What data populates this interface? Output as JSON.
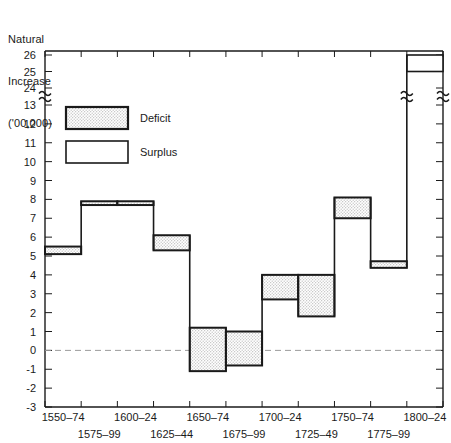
{
  "chart_data": {
    "type": "bar",
    "title": "",
    "ylabel_lines": [
      "Natural",
      "Increase",
      "('00,000)"
    ],
    "xlabel": "",
    "categories": [
      "1550–74",
      "1575–99",
      "1600–24",
      "1625–44",
      "1650–74",
      "1675–99",
      "1700–24",
      "1725–49",
      "1750–74",
      "1775–99",
      "1800–24"
    ],
    "y_tick_labels": [
      "-3",
      "-2",
      "-1",
      "0",
      "1",
      "2",
      "3",
      "4",
      "5",
      "6",
      "7",
      "8",
      "9",
      "10",
      "11",
      "12",
      "13",
      "24",
      "25",
      "26"
    ],
    "ylim": [
      -3,
      26
    ],
    "axis_break": {
      "below": 13,
      "above": 24,
      "note": "y-axis break between 13 and 24"
    },
    "zero_line": 0,
    "grid": false,
    "legend": {
      "position": "upper-left-inside",
      "entries": [
        {
          "label": "Deficit",
          "fill": "stippled"
        },
        {
          "label": "Surplus",
          "fill": "white"
        }
      ]
    },
    "series_note": "Each period drawn as a band (range) between a low and high estimate of natural increase.",
    "bands": [
      {
        "period": "1550–74",
        "low": 5.1,
        "high": 5.5,
        "fill": "stippled"
      },
      {
        "period": "1575–99",
        "low": 7.7,
        "high": 7.9,
        "fill": "stippled"
      },
      {
        "period": "1600–24",
        "low": 7.7,
        "high": 7.9,
        "fill": "stippled"
      },
      {
        "period": "1625–44",
        "low": 5.3,
        "high": 6.1,
        "fill": "stippled"
      },
      {
        "period": "1650–74",
        "low": -1.1,
        "high": 1.2,
        "fill": "stippled"
      },
      {
        "period": "1675–99",
        "low": -0.8,
        "high": 1.0,
        "fill": "stippled"
      },
      {
        "period": "1700–24",
        "low": 2.7,
        "high": 4.0,
        "fill": "stippled"
      },
      {
        "period": "1725–49",
        "low": 1.8,
        "high": 4.0,
        "fill": "stippled"
      },
      {
        "period": "1750–74",
        "low": 7.0,
        "high": 8.1,
        "fill": "stippled"
      },
      {
        "period": "1775–99",
        "low": 13.1,
        "high": 13.5,
        "fill": "stippled"
      },
      {
        "period": "1800–24",
        "low": 25.0,
        "high": 26.0,
        "fill": "white"
      }
    ],
    "colors": {
      "axis": "#1a1a1a",
      "band_stroke": "#1a1a1a",
      "band_stipple": "#e8e8e8",
      "band_white": "#ffffff",
      "zero_line": "#9a9a9a",
      "background": "#ffffff"
    }
  },
  "axis_title": {
    "line1": "Natural",
    "line2": "Increase",
    "line3": "('00,000)"
  },
  "legend": {
    "deficit_label": "Deficit",
    "surplus_label": "Surplus"
  },
  "x_labels_upper": [
    "1550–74",
    "1600–24",
    "1650–74",
    "1700–24",
    "1750–74",
    "1800–24"
  ],
  "x_labels_lower": [
    "1575–99",
    "1625–44",
    "1675–99",
    "1725–49",
    "1775–99"
  ],
  "y_labels": {
    "l_26": "26",
    "l_25": "25",
    "l_24": "24",
    "l_13": "13",
    "l_12": "12",
    "l_11": "11",
    "l_10": "10",
    "l_9": "9",
    "l_8": "8",
    "l_7": "7",
    "l_6": "6",
    "l_5": "5",
    "l_4": "4",
    "l_3": "3",
    "l_2": "2",
    "l_1": "1",
    "l_0": "0",
    "l_m1": "-1",
    "l_m2": "-2",
    "l_m3": "-3"
  }
}
